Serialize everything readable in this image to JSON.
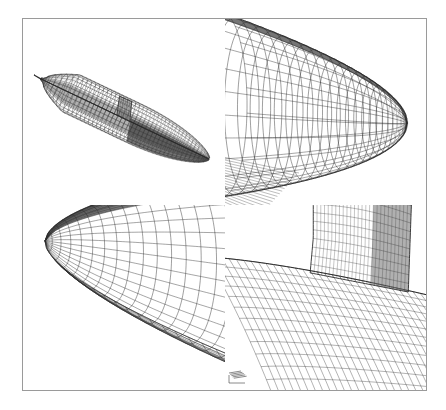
{
  "figure": {
    "title": "Surface grid on submarine hull with sail",
    "frame_color": "#9a9a9a",
    "background_color": "#ffffff",
    "line_color": "#2a2a2a",
    "panel_count": 4
  },
  "panels": [
    {
      "id": "full-hull",
      "name": "Complete hull surface grid",
      "view": "overall body, bow upper-left, stern lower-right",
      "features": [
        "axisymmetric hull",
        "sail",
        "tapered stern"
      ]
    },
    {
      "id": "bow",
      "name": "Bow region grid detail",
      "view": "close-up of forebody, nose point at right"
    },
    {
      "id": "stern",
      "name": "Stern region grid detail",
      "view": "close-up of afterbody, tail point at upper-left"
    },
    {
      "id": "sail",
      "name": "Sail / hull junction grid detail",
      "view": "close-up of conning tower intersection"
    }
  ],
  "chart_data": {
    "type": "line",
    "title": "Surface grid on submarine hull with sail",
    "xlabel": "",
    "ylabel": "",
    "views": [
      {
        "panel": "full-hull",
        "axial_stations": 42,
        "circumferential_stations": 28
      },
      {
        "panel": "bow",
        "axial_stations": 24,
        "circumferential_stations": 22
      },
      {
        "panel": "stern",
        "axial_stations": 20,
        "circumferential_stations": 20
      },
      {
        "panel": "sail",
        "axial_stations": 26,
        "circumferential_stations": 18
      }
    ]
  }
}
